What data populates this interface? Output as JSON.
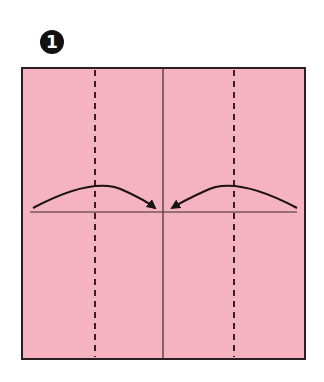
{
  "step": {
    "number": "1"
  },
  "paper": {
    "color": "#f5b3c2",
    "border_color": "#2a1f22",
    "x": 22,
    "y": 68,
    "width": 283,
    "height": 291
  },
  "creases": {
    "center_vertical": {
      "type": "valley-solid",
      "x": 163
    },
    "center_horizontal": {
      "type": "valley-solid",
      "y": 212
    },
    "left_fold_line": {
      "type": "dashed",
      "x": 95
    },
    "right_fold_line": {
      "type": "dashed",
      "x": 234
    }
  },
  "arrows": [
    {
      "name": "fold-left-edge-to-center",
      "from": [
        33,
        207
      ],
      "to": [
        158,
        207
      ]
    },
    {
      "name": "fold-right-edge-to-center",
      "from": [
        297,
        207
      ],
      "to": [
        169,
        207
      ]
    }
  ]
}
